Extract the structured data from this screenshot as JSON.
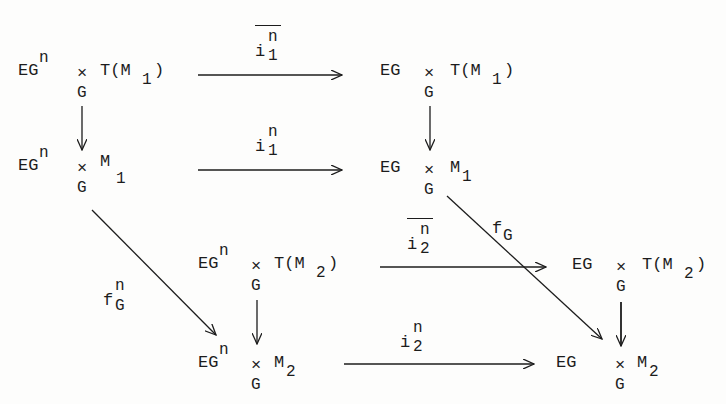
{
  "diagram": {
    "type": "commutative-diagram",
    "nodes": {
      "a": {
        "base": "EG",
        "sup": "n",
        "times": "×",
        "times_sub": "G",
        "rest": "T(M",
        "rest_sub": "1",
        "close": ")"
      },
      "b": {
        "base": "EG",
        "times": "×",
        "times_sub": "G",
        "rest": "T(M",
        "rest_sub": "1",
        "close": ")"
      },
      "c": {
        "base": "EG",
        "sup": "n",
        "times": "×",
        "times_sub": "G",
        "rest": "M",
        "rest_sub": "1"
      },
      "d": {
        "base": "EG",
        "times": "×",
        "times_sub": "G",
        "rest": "M",
        "rest_sub": "1"
      },
      "e": {
        "base": "EG",
        "sup": "n",
        "times": "×",
        "times_sub": "G",
        "rest": "T(M",
        "rest_sub": "2",
        "close": ")"
      },
      "f": {
        "base": "EG",
        "times": "×",
        "times_sub": "G",
        "rest": "T(M",
        "rest_sub": "2",
        "close": ")"
      },
      "g": {
        "base": "EG",
        "sup": "n",
        "times": "×",
        "times_sub": "G",
        "rest": "M",
        "rest_sub": "2"
      },
      "h": {
        "base": "EG",
        "times": "×",
        "times_sub": "G",
        "rest": "M",
        "rest_sub": "2"
      }
    },
    "labels": {
      "i1bar": {
        "base": "i",
        "sup": "n",
        "sub": "1",
        "overline": true
      },
      "i1": {
        "base": "i",
        "sup": "n",
        "sub": "1"
      },
      "i2bar": {
        "base": "i",
        "sup": "n",
        "sub": "2",
        "overline": true
      },
      "i2": {
        "base": "i",
        "sup": "n",
        "sub": "2"
      },
      "fG": {
        "base": "f",
        "sub": "G"
      },
      "fGn": {
        "base": "f",
        "sup": "n",
        "sub": "G"
      }
    },
    "arrows": [
      {
        "from": "a",
        "to": "b",
        "label": "i1bar"
      },
      {
        "from": "a",
        "to": "c"
      },
      {
        "from": "b",
        "to": "d"
      },
      {
        "from": "c",
        "to": "d",
        "label": "i1"
      },
      {
        "from": "c",
        "to": "g",
        "label": "fGn"
      },
      {
        "from": "d",
        "to": "h",
        "label": "fG"
      },
      {
        "from": "e",
        "to": "f",
        "label": "i2bar"
      },
      {
        "from": "e",
        "to": "g"
      },
      {
        "from": "f",
        "to": "h"
      },
      {
        "from": "g",
        "to": "h",
        "label": "i2"
      }
    ]
  }
}
